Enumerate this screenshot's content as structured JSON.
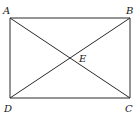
{
  "diagram": {
    "type": "rectangle-with-diagonals",
    "points": {
      "A": {
        "label": "A",
        "x": 10,
        "y": 18
      },
      "B": {
        "label": "B",
        "x": 130,
        "y": 18
      },
      "C": {
        "label": "C",
        "x": 130,
        "y": 98
      },
      "D": {
        "label": "D",
        "x": 10,
        "y": 98
      },
      "E": {
        "label": "E",
        "x": 70,
        "y": 58
      }
    },
    "segments": [
      "AB",
      "BC",
      "CD",
      "DA",
      "AC",
      "BD"
    ],
    "stroke_color": "#2a2a2a"
  }
}
